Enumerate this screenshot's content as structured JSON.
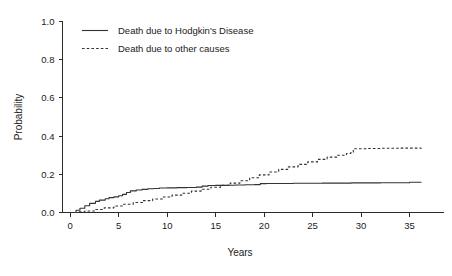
{
  "chart_data": {
    "type": "line",
    "title": "",
    "xlabel": "Years",
    "ylabel": "Probability",
    "xlim": [
      -0.8,
      38.5
    ],
    "ylim": [
      0.0,
      1.0
    ],
    "grid": false,
    "legend_position": "top-left",
    "xticks": [
      "0",
      "5",
      "10",
      "15",
      "20",
      "25",
      "30",
      "35"
    ],
    "xtick_values": [
      0,
      5,
      10,
      15,
      20,
      25,
      30,
      35
    ],
    "yticks": [
      "0.0",
      "0.2",
      "0.4",
      "0.6",
      "0.8",
      "1.0"
    ],
    "ytick_values": [
      0.0,
      0.2,
      0.4,
      0.6,
      0.8,
      1.0
    ],
    "annotations": [
      "Cumulative incidence curves cross at approximately 16 years",
      "Dashed curve steps up near 29 years then plateaus at about 0.335"
    ],
    "series": [
      {
        "name": "Death due to Hodgkin's Disease",
        "style": "solid",
        "color": "#333333",
        "x": [
          0.0,
          0.6,
          1.0,
          1.5,
          2.0,
          2.6,
          3.0,
          3.6,
          4.0,
          4.5,
          5.0,
          5.4,
          5.8,
          6.2,
          6.8,
          7.4,
          8.0,
          8.6,
          9.2,
          10.0,
          11.0,
          12.0,
          13.0,
          13.6,
          14.2,
          15.0,
          16.0,
          17.0,
          18.0,
          19.0,
          19.6,
          20.2,
          21.0,
          23.0,
          26.0,
          29.0,
          32.0,
          35.0,
          36.2
        ],
        "y": [
          0.0,
          0.012,
          0.022,
          0.035,
          0.048,
          0.058,
          0.065,
          0.072,
          0.078,
          0.082,
          0.088,
          0.095,
          0.105,
          0.113,
          0.118,
          0.121,
          0.124,
          0.126,
          0.128,
          0.129,
          0.13,
          0.131,
          0.133,
          0.138,
          0.141,
          0.142,
          0.143,
          0.144,
          0.145,
          0.146,
          0.151,
          0.152,
          0.152,
          0.153,
          0.154,
          0.155,
          0.156,
          0.158,
          0.159
        ]
      },
      {
        "name": "Death due to other causes",
        "style": "dashed",
        "color": "#333333",
        "x": [
          0.0,
          0.8,
          1.5,
          2.5,
          3.5,
          4.5,
          5.5,
          6.5,
          7.5,
          8.5,
          9.5,
          10.5,
          11.5,
          12.5,
          13.5,
          14.5,
          15.5,
          16.5,
          17.5,
          18.5,
          19.5,
          20.5,
          21.5,
          22.5,
          23.5,
          24.5,
          25.5,
          26.5,
          27.5,
          28.5,
          28.9,
          29.2,
          30.5,
          32.0,
          34.0,
          36.2
        ],
        "y": [
          0.0,
          0.004,
          0.008,
          0.016,
          0.024,
          0.034,
          0.043,
          0.052,
          0.062,
          0.071,
          0.081,
          0.091,
          0.101,
          0.112,
          0.122,
          0.132,
          0.142,
          0.154,
          0.166,
          0.182,
          0.197,
          0.212,
          0.226,
          0.239,
          0.252,
          0.265,
          0.278,
          0.29,
          0.3,
          0.309,
          0.312,
          0.334,
          0.335,
          0.336,
          0.337,
          0.338
        ]
      }
    ]
  },
  "legend": {
    "entries": [
      {
        "label": "Death due to Hodgkin's Disease",
        "style": "solid"
      },
      {
        "label": "Death due to other causes",
        "style": "dashed"
      }
    ]
  }
}
